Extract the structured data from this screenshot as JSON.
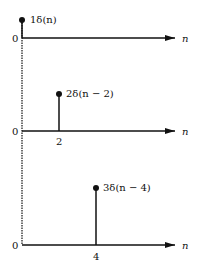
{
  "axis_label": "n",
  "panels": [
    {
      "origin_label": "0",
      "impulse_label": "1δ(n)",
      "tick_label": "",
      "amplitude": 1,
      "shift": 0
    },
    {
      "origin_label": "0",
      "impulse_label": "2δ(n − 2)",
      "tick_label": "2",
      "amplitude": 2,
      "shift": 2
    },
    {
      "origin_label": "0",
      "impulse_label": "3δ(n − 4)",
      "tick_label": "4",
      "amplitude": 3,
      "shift": 4
    }
  ],
  "colors": {
    "ink": "#111111",
    "background": "#ffffff"
  }
}
